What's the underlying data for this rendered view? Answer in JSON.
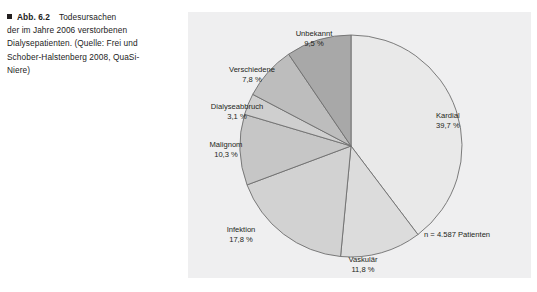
{
  "figure": {
    "marker_icon": "filled-square-bullet",
    "caption_lines": [
      {
        "label": "Abb. 6.2",
        "text": "Todesursachen"
      },
      {
        "text": "der im Jahre 2006 verstorbenen"
      },
      {
        "text": "Dialysepatienten. (Quelle: Frei und"
      },
      {
        "text": "Schober-Halstenberg 2008, QuaSi-"
      },
      {
        "text": "Niere)"
      }
    ]
  },
  "panel": {
    "background_color": "#efeff0",
    "sample_note": "n = 4.587 Patienten"
  },
  "chart_data": {
    "type": "pie",
    "title": "Todesursachen der im Jahre 2006 verstorbenen Dialysepatienten",
    "unit": "%",
    "value_suffix": " %",
    "total_label": "n = 4.587 Patienten",
    "n": 4587,
    "start_angle_deg": 0,
    "direction": "clockwise",
    "legend": "none-inline-labels",
    "categories": [
      "Kardial",
      "Vaskulär",
      "Infektion",
      "Malignom",
      "Dialyseabbruch",
      "Verschiedene",
      "Unbekannt"
    ],
    "values": [
      39.7,
      11.8,
      17.8,
      10.3,
      3.1,
      7.8,
      9.5
    ],
    "value_labels": [
      "39,7 %",
      "11,8 %",
      "17,8 %",
      "10,3 %",
      "3,1 %",
      "7,8 %",
      "9,5 %"
    ],
    "colors": [
      "#e9e9e9",
      "#dcdcdc",
      "#d2d2d2",
      "#bfbfbf",
      "#cfcfcf",
      "#bdbdbd",
      "#a8a8a8"
    ],
    "stroke_color": "#6e6e6e",
    "slices": [
      {
        "name": "Kardial",
        "value": 39.7,
        "value_label": "39,7 %",
        "color": "#e9e9e9"
      },
      {
        "name": "Vaskulär",
        "value": 11.8,
        "value_label": "11,8 %",
        "color": "#dcdcdc"
      },
      {
        "name": "Infektion",
        "value": 17.8,
        "value_label": "17,8 %",
        "color": "#d2d2d2"
      },
      {
        "name": "Malignom",
        "value": 10.3,
        "value_label": "10,3 %",
        "color": "#c6c6c6"
      },
      {
        "name": "Dialyseabbruch",
        "value": 3.1,
        "value_label": "3,1 %",
        "color": "#cfcfcf"
      },
      {
        "name": "Verschiedene",
        "value": 7.8,
        "value_label": "7,8 %",
        "color": "#bdbdbd"
      },
      {
        "name": "Unbekannt",
        "value": 9.5,
        "value_label": "9,5 %",
        "color": "#a8a8a8"
      }
    ]
  }
}
